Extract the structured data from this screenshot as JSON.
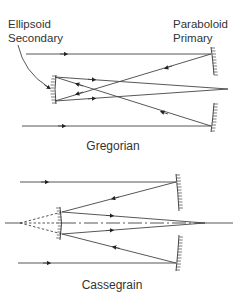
{
  "labels": {
    "secondary_line1": "Ellipsoid",
    "secondary_line2": "Secondary",
    "primary_line1": "Paraboloid",
    "primary_line2": "Primary"
  },
  "captions": {
    "top": "Gregorian",
    "bottom": "Cassegrain"
  },
  "colors": {
    "line": "#333333",
    "text": "#333333",
    "background": "#ffffff"
  }
}
